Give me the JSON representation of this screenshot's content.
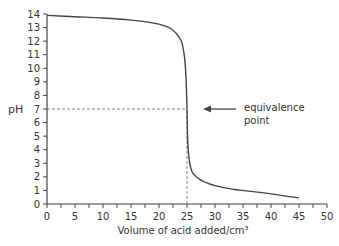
{
  "chart_data": {
    "type": "line",
    "title": "",
    "xlabel": "Volume of acid added/cm³",
    "ylabel": "pH",
    "xlim": [
      0,
      50
    ],
    "ylim": [
      0,
      14
    ],
    "x_ticks": [
      0,
      5,
      10,
      15,
      20,
      25,
      30,
      35,
      40,
      45,
      50
    ],
    "x_tick_labels": [
      "0",
      "5",
      "10",
      "15",
      "20",
      "25",
      "30",
      "35",
      "40",
      "45",
      "50"
    ],
    "y_ticks": [
      0,
      1,
      2,
      3,
      4,
      5,
      6,
      7,
      8,
      9,
      10,
      11,
      12,
      13,
      14
    ],
    "grid": false,
    "series": [
      {
        "name": "titration curve",
        "x": [
          0,
          5,
          10,
          15,
          18,
          20,
          22,
          23,
          24,
          24.5,
          24.8,
          25,
          25.1,
          25.3,
          25.6,
          26,
          27,
          28,
          30,
          33,
          36,
          40,
          45
        ],
        "y": [
          13.9,
          13.8,
          13.7,
          13.55,
          13.4,
          13.25,
          12.95,
          12.6,
          12.0,
          11.0,
          9.5,
          7.0,
          5.0,
          3.6,
          2.8,
          2.3,
          1.9,
          1.65,
          1.35,
          1.1,
          0.95,
          0.75,
          0.45
        ]
      }
    ],
    "reference_lines": [
      {
        "type": "horizontal",
        "y": 7,
        "x_from": 0,
        "x_to": 25,
        "style": "dashed"
      },
      {
        "type": "vertical",
        "x": 25,
        "y_from": 0,
        "y_to": 7,
        "style": "dashed"
      }
    ],
    "annotations": [
      {
        "text_lines": [
          "equivalence",
          "point"
        ],
        "arrow_to": {
          "x": 25,
          "y": 7
        }
      }
    ]
  }
}
